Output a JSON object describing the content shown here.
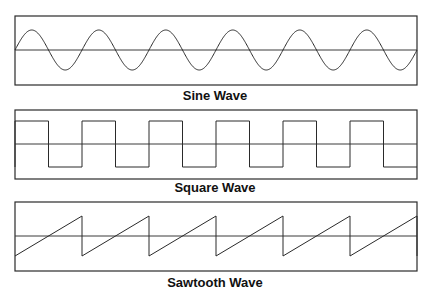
{
  "panels": [
    {
      "id": "sine",
      "label": "Sine Wave",
      "type": "sine",
      "cycles": 6,
      "box": {
        "x": 15,
        "y": 16,
        "w": 402,
        "h": 69
      },
      "axis_y": 50,
      "amplitude": 20,
      "label_top": 89
    },
    {
      "id": "square",
      "label": "Square Wave",
      "type": "square",
      "cycles": 6,
      "box": {
        "x": 15,
        "y": 110,
        "w": 402,
        "h": 69
      },
      "axis_y": 144,
      "amplitude": 23,
      "label_top": 181
    },
    {
      "id": "sawtooth",
      "label": "Sawtooth Wave",
      "type": "sawtooth",
      "cycles": 6,
      "box": {
        "x": 15,
        "y": 202,
        "w": 402,
        "h": 69
      },
      "axis_y": 236,
      "amplitude": 20,
      "label_top": 276
    }
  ],
  "colors": {
    "line": "#2a2a2a",
    "background": "#ffffff"
  }
}
